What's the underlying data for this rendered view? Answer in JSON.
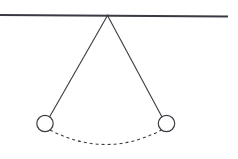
{
  "canvas": {
    "width": 238,
    "height": 159,
    "background": "#ffffff",
    "title": "Pendulum swing diagram"
  },
  "style": {
    "stroke_color": "#3a3a42",
    "support_color": "#3a3a42",
    "arc_color": "#3a3a42",
    "bob_fill": "#ffffff",
    "support_width": 2.2,
    "string_width": 1.1,
    "bob_stroke_width": 1.2,
    "arc_width": 1.1,
    "arc_dash": "3 3"
  },
  "chart_data": {
    "type": "diagram",
    "elements": [
      {
        "name": "support-beam",
        "kind": "line",
        "x1": 0,
        "y1": 15,
        "x2": 228,
        "y2": 16.5
      },
      {
        "name": "pivot-point",
        "kind": "point",
        "x": 107.5,
        "y": 15.5
      },
      {
        "name": "string-left",
        "kind": "line",
        "x1": 107.5,
        "y1": 15.5,
        "x2": 49.5,
        "y2": 117.0
      },
      {
        "name": "string-right",
        "kind": "line",
        "x1": 107.5,
        "y1": 15.5,
        "x2": 162.0,
        "y2": 117.0
      },
      {
        "name": "bob-left",
        "kind": "circle",
        "cx": 45.0,
        "cy": 123.5,
        "r": 8.2
      },
      {
        "name": "bob-right",
        "kind": "circle",
        "cx": 166.5,
        "cy": 123.5,
        "r": 8.2
      },
      {
        "name": "swing-arc",
        "kind": "arc-dashed",
        "start_x": 50.0,
        "start_y": 130.0,
        "end_x": 161.5,
        "end_y": 130.0,
        "control_x": 106.0,
        "control_y": 159.0,
        "lowest_y": 145.0
      }
    ],
    "labels": [],
    "legend": [],
    "grid": false
  }
}
